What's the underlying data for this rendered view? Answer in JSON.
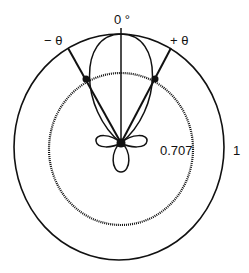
{
  "diagram": {
    "type": "polar radiation pattern",
    "labels": {
      "zero_angle": "0 °",
      "minus_theta": "− θ",
      "plus_theta": "+ θ",
      "half_power_radius": "0.707",
      "unit_radius": "1"
    },
    "colors": {
      "line": "#111111",
      "background": "#ffffff"
    }
  }
}
